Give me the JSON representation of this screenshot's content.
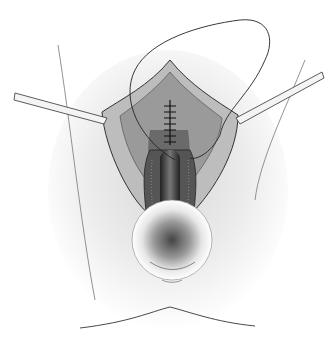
{
  "image": {
    "kind": "surgical-illustration",
    "style": "grayscale pencil drawing",
    "width": 336,
    "height": 341,
    "colors": {
      "background": "#ffffff",
      "shadow": "#cfcfcf",
      "line": "#2a2a2a",
      "tissue_dark": "#3a3a3a",
      "tissue_mid": "#8a8a8a",
      "instrument": "#e8e8e8"
    },
    "elements": [
      {
        "name": "suture-loop",
        "description": "thin suture thread loop above incision"
      },
      {
        "name": "left-retractor",
        "description": "straight instrument entering from left"
      },
      {
        "name": "right-retractor",
        "description": "straight instrument entering from right"
      },
      {
        "name": "sutured-incision",
        "description": "vertical line of stitches at center"
      },
      {
        "name": "opened-tissue",
        "description": "retracted tissue layers"
      },
      {
        "name": "lower-ring",
        "description": "circular anatomical region below"
      }
    ]
  }
}
